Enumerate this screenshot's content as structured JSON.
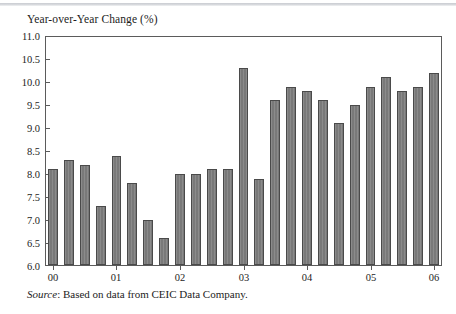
{
  "figure": {
    "axis_title": "Year-over-Year Change (%)",
    "source_keyword": "Source",
    "source_text": ": Based on data from CEIC Data Company."
  },
  "colors": {
    "bar_fill": "#7e7e7e",
    "bar_edge": "#4a4a4a",
    "frame": "#5b5b5b",
    "text": "#1c1c1c",
    "background": "#ffffff",
    "top_rule": "#c9ccd1"
  },
  "chart_data": {
    "type": "bar",
    "title": "Year-over-Year Change (%)",
    "xlabel": "",
    "ylabel": "Year-over-Year Change (%)",
    "ylim": [
      6.0,
      11.0
    ],
    "ytick_labels": [
      "11.0",
      "10.5",
      "10.0",
      "9.5",
      "9.0",
      "8.5",
      "8.0",
      "7.5",
      "7.0",
      "6.5",
      "6.0"
    ],
    "ytick_values": [
      11.0,
      10.5,
      10.0,
      9.5,
      9.0,
      8.5,
      8.0,
      7.5,
      7.0,
      6.5,
      6.0
    ],
    "xtick_labels": [
      "00",
      "01",
      "02",
      "03",
      "04",
      "05",
      "06"
    ],
    "grid": false,
    "legend": null,
    "categories": [
      "00Q1",
      "00Q2",
      "00Q3",
      "00Q4",
      "01Q1",
      "01Q2",
      "01Q3",
      "01Q4",
      "02Q1",
      "02Q2",
      "02Q3",
      "02Q4",
      "03Q1",
      "03Q2",
      "03Q3",
      "03Q4",
      "04Q1",
      "04Q2",
      "04Q3",
      "04Q4",
      "05Q1",
      "05Q2",
      "05Q3",
      "05Q4",
      "06Q1"
    ],
    "values": [
      8.1,
      8.3,
      8.2,
      7.3,
      8.4,
      7.8,
      7.0,
      6.6,
      8.0,
      8.0,
      8.1,
      8.1,
      10.3,
      7.9,
      9.6,
      9.9,
      9.8,
      9.6,
      9.1,
      9.5,
      9.9,
      10.1,
      9.8,
      9.9,
      10.2
    ]
  }
}
